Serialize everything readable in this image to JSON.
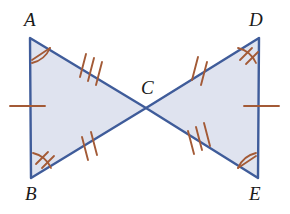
{
  "figure": {
    "kind": "geometry-diagram",
    "colors": {
      "triangle_stroke": "#3f5c9a",
      "triangle_fill": "#dfe3ef",
      "tick_mark": "#a35a36",
      "label_text": "#1a1a1a",
      "background": "#ffffff"
    },
    "labels": {
      "a": "A",
      "b": "B",
      "c": "C",
      "d": "D",
      "e": "E"
    },
    "label_positions": {
      "a": {
        "x": 24,
        "y": 10
      },
      "b": {
        "x": 25,
        "y": 184
      },
      "c": {
        "x": 141,
        "y": 78
      },
      "d": {
        "x": 249,
        "y": 10
      },
      "e": {
        "x": 249,
        "y": 184
      }
    },
    "points": {
      "a": {
        "x": 30,
        "y": 38
      },
      "b": {
        "x": 31,
        "y": 178
      },
      "c": {
        "x": 146,
        "y": 108
      },
      "d": {
        "x": 259,
        "y": 38
      },
      "e": {
        "x": 258,
        "y": 178
      }
    },
    "segments": [
      {
        "name": "AB",
        "from": "a",
        "to": "b",
        "ticks": 1
      },
      {
        "name": "AC",
        "from": "a",
        "to": "c",
        "ticks": 3
      },
      {
        "name": "BC",
        "from": "b",
        "to": "c",
        "ticks": 2
      },
      {
        "name": "DE",
        "from": "d",
        "to": "e",
        "ticks": 1
      },
      {
        "name": "DC",
        "from": "d",
        "to": "c",
        "ticks": 2
      },
      {
        "name": "EC",
        "from": "e",
        "to": "c",
        "ticks": 3
      }
    ],
    "angle_marks": [
      {
        "vertex": "A",
        "ticks": 1
      },
      {
        "vertex": "B",
        "ticks": 2
      },
      {
        "vertex": "D",
        "ticks": 2
      },
      {
        "vertex": "E",
        "ticks": 1
      }
    ]
  }
}
